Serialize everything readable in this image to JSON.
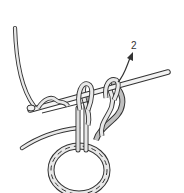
{
  "diagram": {
    "step_label": "2",
    "elements": {
      "hook": "crochet-hook",
      "yarn": "working-yarn",
      "ring": "foundation-chain-ring",
      "arrow": "direction-arrow"
    },
    "colors": {
      "outline": "#333333",
      "yarn_fill": "#e8e8e8",
      "yarn_shade": "#bfbfbf",
      "hook_fill": "#f2f2f2",
      "background": "#ffffff"
    }
  }
}
